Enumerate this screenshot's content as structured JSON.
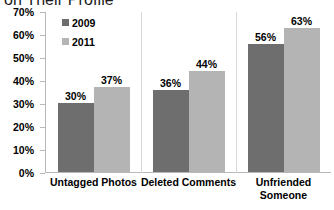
{
  "chart_data": {
    "type": "bar",
    "title": "on Their Profile",
    "xlabel": "",
    "ylabel": "",
    "ylim": [
      0,
      70
    ],
    "ytick_labels": [
      "70%",
      "60%",
      "50%",
      "40%",
      "30%",
      "20%",
      "10%",
      "0%"
    ],
    "ytick_values": [
      70,
      60,
      50,
      40,
      30,
      20,
      10,
      0
    ],
    "grid": false,
    "legend_position": "upper-left-inside",
    "categories": [
      "Untagged Photos",
      "Deleted Comments",
      "Unfriended\nSomeone"
    ],
    "series": [
      {
        "name": "2009",
        "color": "#6e6e6e",
        "values": [
          30,
          36,
          56
        ],
        "labels": [
          "30%",
          "36%",
          "56%"
        ]
      },
      {
        "name": "2011",
        "color": "#b4b4b4",
        "values": [
          37,
          44,
          63
        ],
        "labels": [
          "37%",
          "44%",
          "63%"
        ]
      }
    ]
  }
}
